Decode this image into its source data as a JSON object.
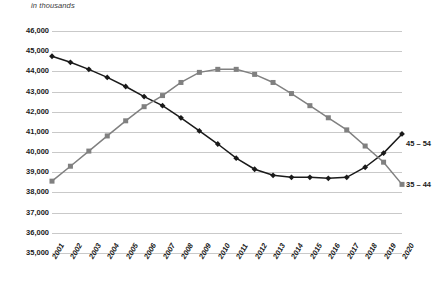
{
  "subtitle": "in thousands",
  "legend": {
    "series_a_label": "45 – 54",
    "series_b_label": "35 – 44"
  },
  "colors": {
    "series_a": "#1a1a1a",
    "series_b": "#808080",
    "gridline": "#c9c9c9",
    "text": "#1a1a1a",
    "background": "#ffffff"
  },
  "chart_data": {
    "type": "line",
    "title": "",
    "subtitle": "in thousands",
    "xlabel": "",
    "ylabel": "",
    "ylim": [
      35000,
      46000
    ],
    "ytick_step": 1000,
    "yticks": [
      46000,
      45000,
      44000,
      43000,
      42000,
      41000,
      40000,
      39000,
      38000,
      37000,
      36000,
      35000
    ],
    "ytick_labels": [
      "46,000",
      "45,000",
      "44,000",
      "43,000",
      "42,000",
      "41,000",
      "40,000",
      "39,000",
      "38,000",
      "37,000",
      "36,000",
      "35,000"
    ],
    "grid": true,
    "legend_position": "right-inline",
    "categories": [
      "2001",
      "2002",
      "2003",
      "2004",
      "2005",
      "2006",
      "2007",
      "2008",
      "2009",
      "2010",
      "2011",
      "2012",
      "2013",
      "2014",
      "2015",
      "2016",
      "2017",
      "2018",
      "2019",
      "2020"
    ],
    "series": [
      {
        "name": "45 – 54",
        "marker": "diamond",
        "color": "#1a1a1a",
        "values": [
          44750,
          44450,
          44100,
          43700,
          43250,
          42750,
          42300,
          41700,
          41050,
          40400,
          39700,
          39150,
          38850,
          38750,
          38750,
          38700,
          38750,
          39250,
          39950,
          40900
        ]
      },
      {
        "name": "35 – 44",
        "marker": "square",
        "color": "#808080",
        "values": [
          38560,
          39300,
          40050,
          40800,
          41550,
          42250,
          42800,
          43450,
          43950,
          44100,
          44100,
          43850,
          43450,
          42900,
          42300,
          41700,
          41100,
          40300,
          39500,
          38400
        ]
      }
    ]
  }
}
